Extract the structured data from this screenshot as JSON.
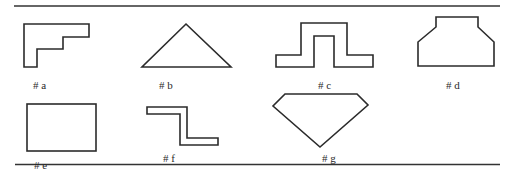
{
  "figure": {
    "shapes": [
      {
        "id": "a",
        "label": "# a",
        "type": "stepped-L polygon"
      },
      {
        "id": "b",
        "label": "# b",
        "type": "triangle"
      },
      {
        "id": "c",
        "label": "# c",
        "type": "hat / top-hat channel polygon"
      },
      {
        "id": "d",
        "label": "# d",
        "type": "chamfered trapezoid polygon"
      },
      {
        "id": "e",
        "label": "# e",
        "type": "rectangle"
      },
      {
        "id": "f",
        "label": "# f",
        "type": "Z-shaped polygon"
      },
      {
        "id": "g",
        "label": "# g",
        "type": "pentagon (gem shape)"
      }
    ],
    "stroke_color": "#2b2b2b",
    "background": "#ffffff"
  }
}
